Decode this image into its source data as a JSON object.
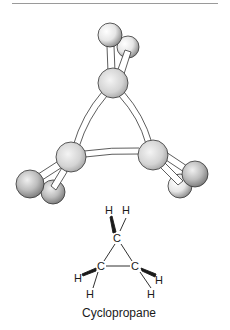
{
  "figure": {
    "caption": "Cyclopropane",
    "formula_labels": {
      "h_top_left": "H",
      "h_top_right": "H",
      "c_top": "C",
      "c_left": "C",
      "c_right": "C",
      "h_left_upper": "H",
      "h_left_lower": "H",
      "h_right_upper": "H",
      "h_right_lower": "H"
    }
  }
}
